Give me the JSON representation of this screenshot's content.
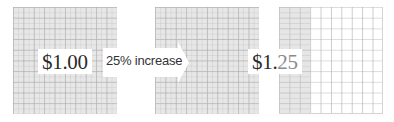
{
  "diagram": {
    "grids": [
      {
        "id": "original",
        "columns": 10,
        "rows": 10,
        "shaded_fraction": 1.0
      },
      {
        "id": "original-copy",
        "columns": 10,
        "rows": 10,
        "shaded_fraction": 1.0
      },
      {
        "id": "increase",
        "columns": 10,
        "rows": 10,
        "shaded_fraction": 0.25
      }
    ],
    "original_price": "$1.00",
    "arrow_label": "25% increase",
    "new_price_base": "$1.",
    "new_price_added": "25",
    "colors": {
      "grid_fill": "#e7e7e7",
      "grid_line": "#aaaaaa",
      "label_bg": "#ffffff",
      "label_text": "#2b2b2b",
      "added_text": "#8a8a8a"
    }
  }
}
